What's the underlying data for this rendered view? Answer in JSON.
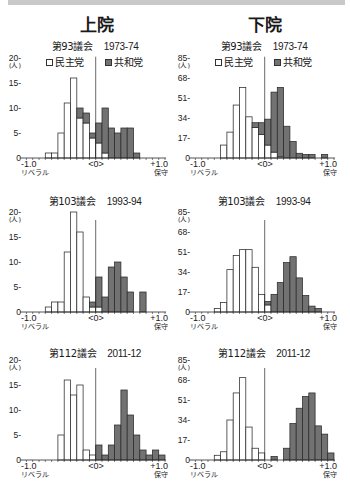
{
  "sections": {
    "senate": "上院",
    "house": "下院"
  },
  "legend": {
    "dem": "民主党",
    "rep": "共和党"
  },
  "axis": {
    "min_label": "-1.0",
    "center_label": "<0>",
    "max_label": "+1.0",
    "left_caption": "リベラル",
    "right_caption": "保守",
    "unit": "(人)"
  },
  "colors": {
    "dem_fill": "#ffffff",
    "rep_fill": "#727272",
    "stroke": "#2a2a2a",
    "strip": "#c9c9c9"
  },
  "panels": [
    {
      "chamber": "上院",
      "session": "第93議会",
      "years": "1973-74"
    },
    {
      "chamber": "下院",
      "session": "第93議会",
      "years": "1973-74"
    },
    {
      "chamber": "上院",
      "session": "第103議会",
      "years": "1993-94"
    },
    {
      "chamber": "下院",
      "session": "第103議会",
      "years": "1993-94"
    },
    {
      "chamber": "上院",
      "session": "第112議会",
      "years": "2011-12"
    },
    {
      "chamber": "下院",
      "session": "第112議会",
      "years": "2011-12"
    }
  ],
  "chart_data": [
    {
      "type": "bar",
      "stacked": true,
      "chamber": "上院",
      "title": "第93議会 1973-74",
      "categories": [
        "-1.1",
        "-1.0",
        "-0.9",
        "-0.8",
        "-0.7",
        "-0.6",
        "-0.5",
        "-0.4",
        "-0.3",
        "-0.2",
        "-0.1",
        "0.0",
        "0.1",
        "0.2",
        "0.3",
        "0.4",
        "0.5",
        "0.6",
        "0.7",
        "0.8",
        "0.9",
        "1.0"
      ],
      "bin_width": 0.1,
      "series": [
        {
          "name": "民主党",
          "values": [
            0,
            0,
            0,
            1,
            1,
            5,
            11,
            16,
            8,
            7,
            4,
            3,
            1,
            0,
            0,
            0,
            0,
            0,
            0,
            0,
            0,
            0
          ]
        },
        {
          "name": "共和党",
          "values": [
            0,
            0,
            0,
            0,
            0,
            0,
            0,
            0,
            2,
            2,
            1,
            4,
            9,
            6,
            5,
            6,
            6,
            1,
            0,
            0,
            0,
            0
          ]
        }
      ],
      "xlabel": "",
      "ylabel": "(人)",
      "xlim": [
        -1.1,
        1.1
      ],
      "ylim": [
        0,
        20
      ],
      "xticks": [
        "-1.0",
        "<0>",
        "+1.0"
      ],
      "xtick_captions": [
        "リベラル",
        "保守"
      ],
      "yticks": [
        0,
        5,
        10,
        15,
        20
      ],
      "ytick_labels": [
        "0",
        "5-",
        "10-",
        "15-",
        "20-"
      ],
      "legend": [
        "民主党",
        "共和党"
      ],
      "legend_position": "top",
      "grid": false
    },
    {
      "type": "bar",
      "stacked": true,
      "chamber": "下院",
      "title": "第93議会 1973-74",
      "categories": [
        "-1.1",
        "-1.0",
        "-0.9",
        "-0.8",
        "-0.7",
        "-0.6",
        "-0.5",
        "-0.4",
        "-0.3",
        "-0.2",
        "-0.1",
        "0.0",
        "0.1",
        "0.2",
        "0.3",
        "0.4",
        "0.5",
        "0.6",
        "0.7",
        "0.8",
        "0.9",
        "1.0"
      ],
      "bin_width": 0.1,
      "series": [
        {
          "name": "民主党",
          "values": [
            0,
            0,
            0,
            0,
            11,
            22,
            45,
            60,
            35,
            26,
            20,
            11,
            5,
            1,
            0,
            0,
            0,
            0,
            0,
            0,
            0,
            0
          ]
        },
        {
          "name": "共和党",
          "values": [
            0,
            0,
            0,
            0,
            0,
            0,
            0,
            0,
            0,
            4,
            10,
            22,
            51,
            59,
            27,
            14,
            4,
            3,
            3,
            0,
            3,
            0
          ]
        }
      ],
      "xlabel": "",
      "ylabel": "(人)",
      "xlim": [
        -1.1,
        1.1
      ],
      "ylim": [
        0,
        85
      ],
      "xticks": [
        "-1.0",
        "<0>",
        "+1.0"
      ],
      "xtick_captions": [
        "リベラル",
        "保守"
      ],
      "yticks": [
        0,
        17,
        34,
        51,
        68,
        85
      ],
      "ytick_labels": [
        "0",
        "17-",
        "34-",
        "51-",
        "68-",
        "85-"
      ],
      "legend": [
        "民主党",
        "共和党"
      ],
      "legend_position": "top",
      "grid": false
    },
    {
      "type": "bar",
      "stacked": true,
      "chamber": "上院",
      "title": "第103議会 1993-94",
      "categories": [
        "-1.1",
        "-1.0",
        "-0.9",
        "-0.8",
        "-0.7",
        "-0.6",
        "-0.5",
        "-0.4",
        "-0.3",
        "-0.2",
        "-0.1",
        "0.0",
        "0.1",
        "0.2",
        "0.3",
        "0.4",
        "0.5",
        "0.6",
        "0.7",
        "0.8",
        "0.9",
        "1.0"
      ],
      "bin_width": 0.1,
      "series": [
        {
          "name": "民主党",
          "values": [
            0,
            0,
            0,
            1,
            2,
            2,
            12,
            20,
            16,
            3,
            1,
            1,
            0,
            0,
            0,
            0,
            0,
            0,
            0,
            0,
            0,
            0
          ]
        },
        {
          "name": "共和党",
          "values": [
            0,
            0,
            0,
            0,
            0,
            0,
            0,
            0,
            0,
            0,
            1,
            6,
            3,
            9,
            10,
            7,
            4,
            0,
            4,
            0,
            0,
            0
          ]
        }
      ],
      "xlabel": "",
      "ylabel": "(人)",
      "xlim": [
        -1.1,
        1.1
      ],
      "ylim": [
        0,
        20
      ],
      "xticks": [
        "-1.0",
        "<0>",
        "+1.0"
      ],
      "xtick_captions": [
        "リベラル",
        "保守"
      ],
      "yticks": [
        0,
        5,
        10,
        15,
        20
      ],
      "ytick_labels": [
        "0",
        "5-",
        "10-",
        "15-",
        "20-"
      ],
      "grid": false
    },
    {
      "type": "bar",
      "stacked": true,
      "chamber": "下院",
      "title": "第103議会 1993-94",
      "categories": [
        "-1.1",
        "-1.0",
        "-0.9",
        "-0.8",
        "-0.7",
        "-0.6",
        "-0.5",
        "-0.4",
        "-0.3",
        "-0.2",
        "-0.1",
        "0.0",
        "0.1",
        "0.2",
        "0.3",
        "0.4",
        "0.5",
        "0.6",
        "0.7",
        "0.8",
        "0.9",
        "1.0"
      ],
      "bin_width": 0.1,
      "series": [
        {
          "name": "民主党",
          "values": [
            0,
            0,
            0,
            3,
            8,
            36,
            48,
            53,
            53,
            38,
            15,
            6,
            0,
            0,
            0,
            0,
            0,
            0,
            0,
            0,
            0,
            0
          ]
        },
        {
          "name": "共和党",
          "values": [
            0,
            0,
            0,
            0,
            0,
            0,
            0,
            0,
            0,
            0,
            0,
            3,
            15,
            25,
            42,
            47,
            29,
            14,
            5,
            3,
            0,
            0
          ]
        }
      ],
      "xlabel": "",
      "ylabel": "(人)",
      "xlim": [
        -1.1,
        1.1
      ],
      "ylim": [
        0,
        85
      ],
      "xticks": [
        "-1.0",
        "<0>",
        "+1.0"
      ],
      "xtick_captions": [
        "リベラル",
        "保守"
      ],
      "yticks": [
        0,
        17,
        34,
        51,
        68,
        85
      ],
      "ytick_labels": [
        "0",
        "17-",
        "34-",
        "51-",
        "68-",
        "85-"
      ],
      "grid": false
    },
    {
      "type": "bar",
      "stacked": true,
      "chamber": "上院",
      "title": "第112議会 2011-12",
      "categories": [
        "-1.1",
        "-1.0",
        "-0.9",
        "-0.8",
        "-0.7",
        "-0.6",
        "-0.5",
        "-0.4",
        "-0.3",
        "-0.2",
        "-0.1",
        "0.0",
        "0.1",
        "0.2",
        "0.3",
        "0.4",
        "0.5",
        "0.6",
        "0.7",
        "0.8",
        "0.9",
        "1.0"
      ],
      "bin_width": 0.1,
      "series": [
        {
          "name": "民主党",
          "values": [
            0,
            0,
            0,
            0,
            0,
            5,
            16,
            13,
            15,
            2,
            1,
            0,
            0,
            0,
            0,
            0,
            0,
            0,
            0,
            0,
            0,
            0
          ]
        },
        {
          "name": "共和党",
          "values": [
            0,
            0,
            0,
            0,
            0,
            0,
            0,
            0,
            0,
            0,
            0,
            3,
            1,
            3,
            7,
            14,
            9,
            5,
            2,
            1,
            2,
            1
          ]
        }
      ],
      "xlabel": "",
      "ylabel": "(人)",
      "xlim": [
        -1.1,
        1.1
      ],
      "ylim": [
        0,
        20
      ],
      "xticks": [
        "-1.0",
        "<0>",
        "+1.0"
      ],
      "xtick_captions": [
        "リベラル",
        "保守"
      ],
      "yticks": [
        0,
        5,
        10,
        15,
        20
      ],
      "ytick_labels": [
        "0",
        "5-",
        "10-",
        "15-",
        "20-"
      ],
      "grid": false
    },
    {
      "type": "bar",
      "stacked": true,
      "chamber": "下院",
      "title": "第112議会 2011-12",
      "categories": [
        "-1.1",
        "-1.0",
        "-0.9",
        "-0.8",
        "-0.7",
        "-0.6",
        "-0.5",
        "-0.4",
        "-0.3",
        "-0.2",
        "-0.1",
        "0.0",
        "0.1",
        "0.2",
        "0.3",
        "0.4",
        "0.5",
        "0.6",
        "0.7",
        "0.8",
        "0.9",
        "1.0"
      ],
      "bin_width": 0.1,
      "series": [
        {
          "name": "民主党",
          "values": [
            0,
            0,
            0,
            4,
            7,
            34,
            57,
            70,
            28,
            10,
            6,
            0,
            0,
            0,
            0,
            0,
            0,
            0,
            0,
            0,
            0,
            0
          ]
        },
        {
          "name": "共和党",
          "values": [
            0,
            0,
            0,
            0,
            0,
            0,
            0,
            0,
            0,
            0,
            0,
            0,
            3,
            0,
            10,
            31,
            44,
            54,
            57,
            29,
            22,
            6
          ]
        }
      ],
      "xlabel": "",
      "ylabel": "(人)",
      "xlim": [
        -1.1,
        1.1
      ],
      "ylim": [
        0,
        85
      ],
      "xticks": [
        "-1.0",
        "<0>",
        "+1.0"
      ],
      "xtick_captions": [
        "リベラル",
        "保守"
      ],
      "yticks": [
        0,
        17,
        34,
        51,
        68,
        85
      ],
      "ytick_labels": [
        "0",
        "17-",
        "34-",
        "51-",
        "68-",
        "85-"
      ],
      "grid": false
    }
  ]
}
